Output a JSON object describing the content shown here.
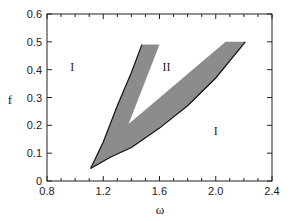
{
  "chart_data": {
    "type": "area",
    "title": "",
    "xlabel": "ω",
    "ylabel": "f",
    "xlim": [
      0.8,
      2.4
    ],
    "ylim": [
      0,
      0.6
    ],
    "xticks": [
      "0.8",
      "1.2",
      "1.6",
      "2.0",
      "2.4"
    ],
    "yticks": [
      "0",
      "0.1",
      "0.2",
      "0.3",
      "0.4",
      "0.5",
      "0.6"
    ],
    "grid": false,
    "legend": null,
    "shaded_region": {
      "description": "Gray V-shaped band region",
      "outer_boundary": [
        [
          1.11,
          0.045
        ],
        [
          1.2,
          0.14
        ],
        [
          1.3,
          0.27
        ],
        [
          1.4,
          0.39
        ],
        [
          1.475,
          0.49
        ]
      ],
      "left_band_top": [
        [
          1.475,
          0.49
        ],
        [
          1.6,
          0.49
        ]
      ],
      "inner_boundary": [
        [
          1.6,
          0.49
        ],
        [
          1.38,
          0.205
        ],
        [
          2.07,
          0.5
        ]
      ],
      "right_band_top": [
        [
          2.07,
          0.5
        ],
        [
          2.21,
          0.5
        ]
      ],
      "lower_boundary": [
        [
          2.21,
          0.5
        ],
        [
          2.0,
          0.37
        ],
        [
          1.8,
          0.27
        ],
        [
          1.6,
          0.19
        ],
        [
          1.4,
          0.12
        ],
        [
          1.25,
          0.085
        ],
        [
          1.11,
          0.045
        ]
      ]
    },
    "annotations": [
      {
        "text": "I",
        "x": 0.98,
        "y": 0.41
      },
      {
        "text": "II",
        "x": 1.65,
        "y": 0.41
      },
      {
        "text": "I",
        "x": 2.0,
        "y": 0.18
      }
    ]
  },
  "labels": {
    "x_axis": "ω",
    "y_axis": "f",
    "region_I_upper": "I",
    "region_II": "II",
    "region_I_lower": "I"
  }
}
